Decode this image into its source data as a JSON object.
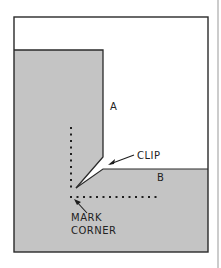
{
  "diagram": {
    "labels": {
      "piece_a": "A",
      "piece_b": "B",
      "clip": "CLIP",
      "mark_line1": "MARK",
      "mark_line2": "CORNER"
    },
    "colors": {
      "background": "#ffffff",
      "material": "#c4c4c4",
      "outline": "#2a2a2a",
      "ink": "#1e1e1e"
    }
  }
}
